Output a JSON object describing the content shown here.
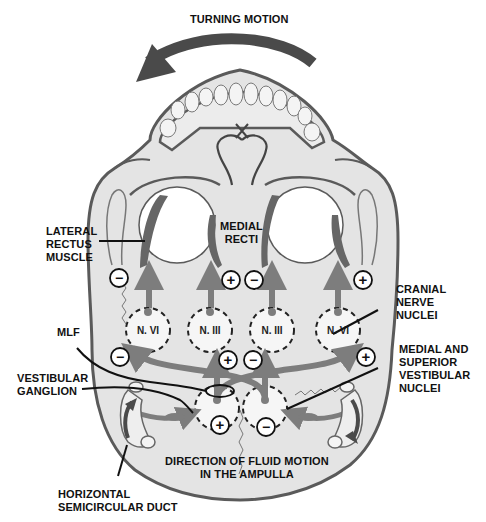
{
  "title": "TURNING MOTION",
  "labels": {
    "lateral_rectus": "LATERAL\nRECTUS\nMUSCLE",
    "medial_recti": "MEDIAL\nRECTI",
    "cranial_nerve_nuclei": "CRANIAL\nNERVE\nNUCLEI",
    "mlf": "MLF",
    "vestibular_ganglion": "VESTIBULAR\nGANGLION",
    "medial_superior_vestibular_nuclei": "MEDIAL AND\nSUPERIOR\nVESTIBULAR\nNUCLEI",
    "fluid_motion": "DIRECTION OF FLUID MOTION\nIN THE AMPULLA",
    "semicircular_duct": "HORIZONTAL\nSEMICIRCULAR DUCT"
  },
  "nuclei": [
    {
      "id": "left-n6",
      "label": "N. VI"
    },
    {
      "id": "left-n3",
      "label": "N. III"
    },
    {
      "id": "right-n3",
      "label": "N. III"
    },
    {
      "id": "right-n6",
      "label": "N. VI"
    }
  ],
  "signs": {
    "left_lateral_rectus": "−",
    "left_medial_rectus": "+",
    "right_medial_rectus": "−",
    "right_lateral_rectus": "+",
    "left_n6_input": "−",
    "left_n3_input": "+",
    "right_n3_input": "−",
    "right_n6_input": "+",
    "left_vestibular_nucleus": "+",
    "right_vestibular_nucleus": "−"
  },
  "colors": {
    "skull_fill": "#e4e4e4",
    "skull_outline": "#5a5a5a",
    "pathway": "#7d7d7d",
    "muscle": "#666666",
    "arrow": "#4a4a4a",
    "text": "#111111"
  }
}
